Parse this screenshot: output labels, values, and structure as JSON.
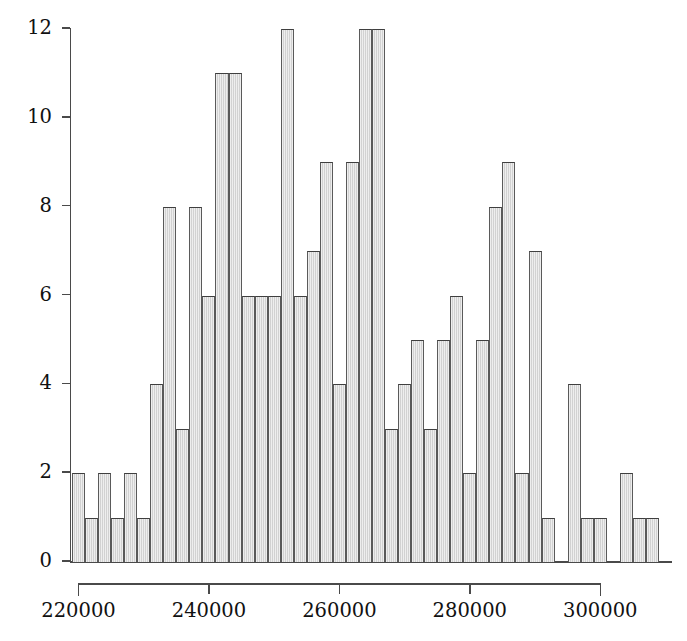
{
  "chart_data": {
    "type": "bar",
    "title": "",
    "subtitle": "",
    "xlabel": "",
    "ylabel": "",
    "xlim": [
      219000,
      311000
    ],
    "ylim": [
      0,
      12
    ],
    "grid": false,
    "legend": null,
    "bin_width": 2000,
    "x_ticks": [
      220000,
      240000,
      260000,
      280000,
      300000
    ],
    "x_tick_labels": [
      "220000",
      "240000",
      "260000",
      "280000",
      "300000"
    ],
    "y_ticks": [
      0,
      2,
      4,
      6,
      8,
      10,
      12
    ],
    "y_tick_labels": [
      "0",
      "2",
      "4",
      "6",
      "8",
      "10",
      "12"
    ],
    "bin_starts": [
      219000,
      221000,
      223000,
      225000,
      227000,
      229000,
      231000,
      233000,
      235000,
      237000,
      239000,
      241000,
      243000,
      245000,
      247000,
      249000,
      251000,
      253000,
      255000,
      257000,
      259000,
      261000,
      263000,
      265000,
      267000,
      269000,
      271000,
      273000,
      275000,
      277000,
      279000,
      281000,
      283000,
      285000,
      287000,
      289000,
      291000,
      293000,
      295000,
      297000,
      299000,
      301000,
      303000,
      305000,
      307000,
      309000
    ],
    "bin_centers": [
      220000,
      222000,
      224000,
      226000,
      228000,
      230000,
      232000,
      234000,
      236000,
      238000,
      240000,
      242000,
      244000,
      246000,
      248000,
      250000,
      252000,
      254000,
      256000,
      258000,
      260000,
      262000,
      264000,
      266000,
      268000,
      270000,
      272000,
      274000,
      276000,
      278000,
      280000,
      282000,
      284000,
      286000,
      288000,
      290000,
      292000,
      294000,
      296000,
      298000,
      300000,
      302000,
      304000,
      306000,
      308000,
      310000
    ],
    "values": [
      2,
      1,
      2,
      1,
      2,
      1,
      4,
      8,
      3,
      8,
      6,
      11,
      11,
      6,
      6,
      6,
      12,
      6,
      7,
      9,
      4,
      9,
      12,
      12,
      3,
      4,
      5,
      3,
      5,
      6,
      2,
      5,
      8,
      9,
      2,
      7,
      1,
      0,
      4,
      1,
      1,
      0,
      2,
      1,
      1,
      0
    ],
    "colors": {
      "bar_fill": "#d9d9d9",
      "bar_edge": "#4a4a4a",
      "axis": "#4a4a4a",
      "text": "#111111",
      "background": "#ffffff"
    }
  },
  "axes": {
    "y_axis_name": "frequency-axis",
    "x_axis_name": "value-axis"
  }
}
